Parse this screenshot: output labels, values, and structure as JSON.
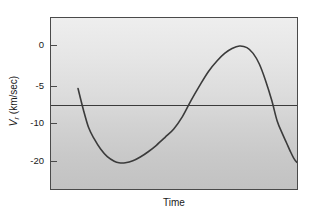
{
  "chart_data": {
    "type": "line",
    "title": "",
    "xlabel": "Time",
    "ylabel": "V_r (km/sec)",
    "ylabel_symbol": "V",
    "ylabel_subscript": "r",
    "ylabel_units": "(km/sec)",
    "grid": false,
    "legend": null,
    "xlim": [
      0,
      1
    ],
    "xticks": [],
    "xticklabels": [],
    "ylim": [
      -24.5,
      5.5
    ],
    "yticks": [
      0,
      -5,
      -10,
      -20
    ],
    "yticklabels": [
      "0",
      "-5",
      "-10",
      "-20"
    ],
    "ytick_pixel_y": [
      45,
      86,
      123,
      161
    ],
    "annotations": [
      {
        "name": "systemic-velocity-line",
        "type": "horizontal-line",
        "y_value": -7.5,
        "label": ""
      }
    ],
    "series": [
      {
        "name": "radial-velocity-curve",
        "color": "#3b3b3b",
        "linewidth": 1.6,
        "points": [
          [
            0.109,
            -5.2
          ],
          [
            0.13,
            -8.0
          ],
          [
            0.152,
            -11.0
          ],
          [
            0.175,
            -14.0
          ],
          [
            0.2,
            -16.6
          ],
          [
            0.227,
            -18.6
          ],
          [
            0.255,
            -19.8
          ],
          [
            0.274,
            -20.2
          ],
          [
            0.3,
            -20.2
          ],
          [
            0.33,
            -19.7
          ],
          [
            0.36,
            -18.7
          ],
          [
            0.392,
            -17.3
          ],
          [
            0.425,
            -15.6
          ],
          [
            0.46,
            -13.5
          ],
          [
            0.495,
            -11.3
          ],
          [
            0.53,
            -9.0
          ],
          [
            0.565,
            -6.8
          ],
          [
            0.6,
            -4.8
          ],
          [
            0.635,
            -3.1
          ],
          [
            0.67,
            -1.8
          ],
          [
            0.7,
            -0.9
          ],
          [
            0.73,
            -0.3
          ],
          [
            0.76,
            0.0
          ],
          [
            0.79,
            -0.2
          ],
          [
            0.815,
            -0.9
          ],
          [
            0.84,
            -2.2
          ],
          [
            0.865,
            -4.2
          ],
          [
            0.89,
            -6.8
          ],
          [
            0.912,
            -9.6
          ],
          [
            0.932,
            -12.4
          ],
          [
            0.95,
            -15.0
          ],
          [
            0.965,
            -17.2
          ],
          [
            0.978,
            -18.9
          ],
          [
            0.99,
            -20.0
          ],
          [
            0.998,
            -20.3
          ]
        ]
      }
    ],
    "colors": {
      "curve": "#3b3b3b",
      "axis": "#4a4a4a",
      "reference_line": "#3b3b3b",
      "plot_background_top": "#eeeeee",
      "plot_background_bottom": "#c2c2c2",
      "page_background": "#ffffff",
      "text": "#1a1a1a"
    }
  }
}
